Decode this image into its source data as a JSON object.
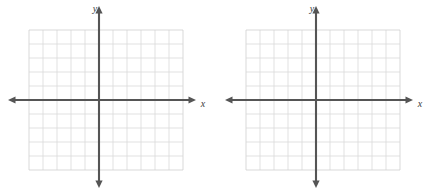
{
  "page": {
    "background_color": "#ffffff",
    "width": 434,
    "height": 194
  },
  "style": {
    "grid_line_color": "#d9d9d9",
    "grid_border_color": "#cfcfcf",
    "axis_color": "#555555",
    "label_color": "#3b3b3b"
  },
  "graphs": [
    {
      "id": "left",
      "name": "coordinate-plane-left",
      "x_axis_label": "x",
      "y_axis_label": "y",
      "grid": {
        "columns": 11,
        "rows": 10,
        "cell_size": 14,
        "left": 29,
        "top": 30,
        "right": 183,
        "bottom": 170
      },
      "origin": {
        "x": 99,
        "y": 100
      },
      "axes": {
        "x_start": 8,
        "x_end": 196,
        "y_start": 6,
        "y_end": 188
      },
      "labels": {
        "x_pos": {
          "x": 203,
          "y": 104
        },
        "y_pos": {
          "x": 94,
          "y": 11
        }
      }
    },
    {
      "id": "right",
      "name": "coordinate-plane-right",
      "x_axis_label": "x",
      "y_axis_label": "y",
      "grid": {
        "columns": 11,
        "rows": 10,
        "cell_size": 14,
        "left": 29,
        "top": 30,
        "right": 183,
        "bottom": 170
      },
      "origin": {
        "x": 99,
        "y": 100
      },
      "axes": {
        "x_start": 8,
        "x_end": 196,
        "y_start": 6,
        "y_end": 188
      },
      "labels": {
        "x_pos": {
          "x": 203,
          "y": 104
        },
        "y_pos": {
          "x": 94,
          "y": 11
        }
      }
    }
  ],
  "chart_data": {
    "type": "scatter",
    "title": "",
    "subtitle": "",
    "xlabel": "x",
    "ylabel": "y",
    "xlim": [
      -5.5,
      5.5
    ],
    "ylim": [
      -5,
      5
    ],
    "grid": true,
    "legend": null,
    "series": [
      {
        "name": "left-plane",
        "x": [],
        "y": []
      },
      {
        "name": "right-plane",
        "x": [],
        "y": []
      }
    ],
    "annotations": [],
    "note": "Two empty Cartesian coordinate planes; no data points plotted."
  }
}
